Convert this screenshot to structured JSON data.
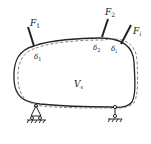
{
  "diagram": {
    "body_label": {
      "main": "V",
      "sub": "s"
    },
    "forces": [
      {
        "main": "F",
        "sub": "1"
      },
      {
        "main": "F",
        "sub": "2"
      },
      {
        "main": "F",
        "sub": "i"
      }
    ],
    "displacements": [
      {
        "main": "δ",
        "sub": "1"
      },
      {
        "main": "δ",
        "sub": "2"
      },
      {
        "main": "δ",
        "sub": "i"
      }
    ],
    "supports": [
      "pin-support",
      "roller-support"
    ],
    "colors": {
      "outline": "#222222",
      "deformed": "#777777"
    }
  }
}
